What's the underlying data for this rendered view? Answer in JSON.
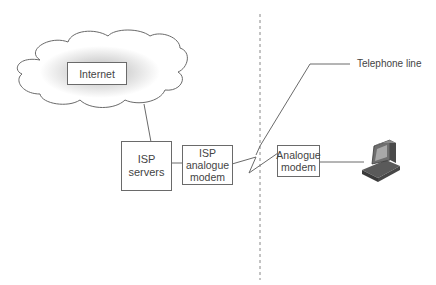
{
  "diagram": {
    "nodes": {
      "internet": {
        "label": "Internet"
      },
      "isp_servers": {
        "line1": "ISP",
        "line2": "servers"
      },
      "isp_modem": {
        "line1": "ISP",
        "line2": "analogue",
        "line3": "modem"
      },
      "user_modem": {
        "line1": "Analogue",
        "line2": "modem"
      },
      "computer": {
        "icon": "computer-icon"
      }
    },
    "annotations": {
      "telephone_line": "Telephone line"
    },
    "colors": {
      "line": "#6a6a6a",
      "divider": "#888888",
      "cloud_shade": "#bdbdbd"
    }
  }
}
